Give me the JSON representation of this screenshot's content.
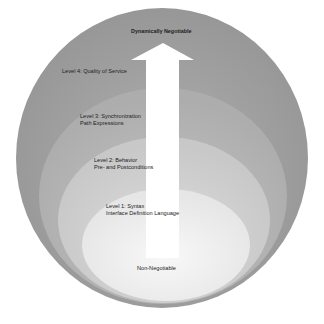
{
  "diagram": {
    "type": "nested-levels-with-arrow",
    "arrow": {
      "top_label": "Dynamically Negotiable",
      "bottom_label": "Non-Negotiable",
      "color": "#ffffff"
    },
    "levels": [
      {
        "id": "level-4",
        "title": "Level 4: Quality of Service",
        "subtitle": "",
        "color": "#9d9d9d"
      },
      {
        "id": "level-3",
        "title": "Level 3: Synchronization",
        "subtitle": "Path Expressions",
        "color": "#b4b4b4"
      },
      {
        "id": "level-2",
        "title": "Level 2: Behavior",
        "subtitle": "Pre- and Postconditions",
        "color": "#cfcfcf"
      },
      {
        "id": "level-1",
        "title": "Level 1: Syntax",
        "subtitle": "Interface Definition Language",
        "color": "#ececec"
      }
    ],
    "core_color": "#f7f7f7"
  }
}
